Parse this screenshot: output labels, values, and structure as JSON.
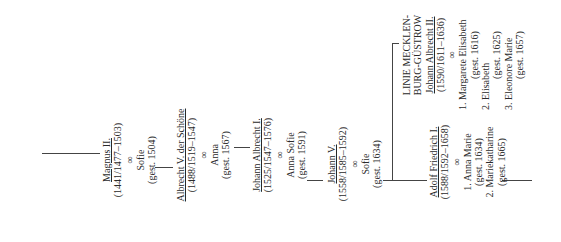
{
  "diagram": {
    "type": "genealogy-tree",
    "orientation": "rotated-90-ccw",
    "generations": [
      {
        "name": "Magnus II.",
        "dates": "(1441/1477–1503)",
        "marriage_symbol": "∞",
        "spouses": [
          "Sofie",
          "(gest. 1504)"
        ]
      },
      {
        "name": "Albrecht V. der Schöne",
        "dates": "(1488/1519–1547)",
        "marriage_symbol": "∞",
        "spouses": [
          "Anna",
          "(gest. 1567)"
        ]
      },
      {
        "name": "Johann Albrecht I.",
        "dates": "(1525/1547–1576)",
        "marriage_symbol": "∞",
        "spouses": [
          "Anna Sofie",
          "(gest. 1591)"
        ]
      },
      {
        "name": "Johann V.",
        "dates": "(1558/1585–1592)",
        "marriage_symbol": "∞",
        "spouses": [
          "Sofie",
          "(gest. 1634)"
        ]
      },
      {
        "name": "Adolf Friedrich I.",
        "dates": "(1588/1592–1658)",
        "marriage_symbol": "∞",
        "spouses": [
          "1. Anna Marie",
          "(gest. 1634)",
          "2. Mariekatharine",
          "(gest. 1665)"
        ]
      }
    ],
    "branch": {
      "line_title_1": "LINIE MECKLEN-",
      "line_title_2": "BURG-GÜSTROW",
      "name": "Johann Albrecht II.",
      "dates": "(1590/1611–1636)",
      "marriage_symbol": "∞",
      "spouses": [
        "1. Margarete Elisabeth",
        "(gest. 1616)",
        "2. Elisabeth",
        "(gest. 1625)",
        "3. Eleonore Marie",
        "(gest. 1657)"
      ]
    }
  }
}
